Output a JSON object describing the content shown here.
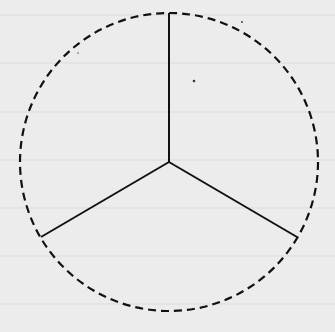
{
  "diagram": {
    "type": "circle-divided-into-three-equal-parts",
    "background": "#ececec",
    "ruled_line_color": "#dddddd",
    "stroke_color": "#111111",
    "circle": {
      "cx": 169,
      "cy": 162,
      "r": 149,
      "style": "dashed"
    },
    "center": {
      "x": 169,
      "y": 162
    },
    "spokes": [
      {
        "x2": 169,
        "y2": 13
      },
      {
        "x2": 41,
        "y2": 237
      },
      {
        "x2": 297,
        "y2": 237
      }
    ],
    "sectors": 3
  }
}
